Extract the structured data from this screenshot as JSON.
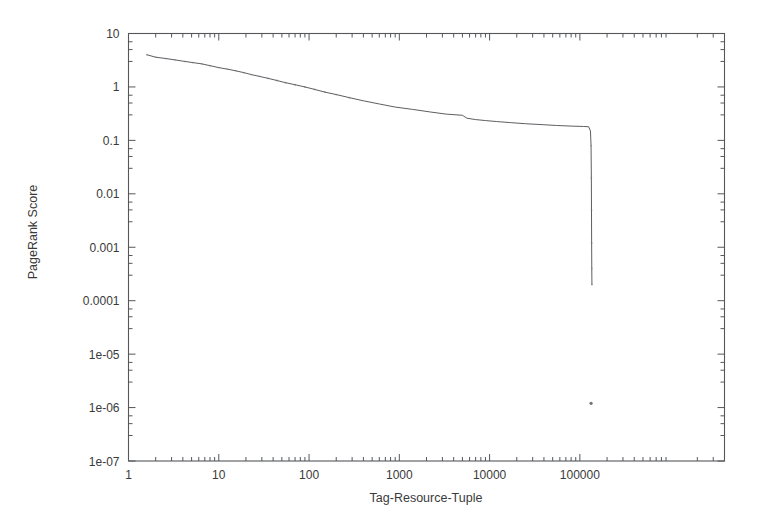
{
  "chart_data": {
    "type": "line",
    "title": "",
    "subtitle": "",
    "xlabel": "Tag-Resource-Tuple",
    "ylabel": "PageRank Score",
    "xscale": "log",
    "yscale": "log",
    "xlim": [
      1,
      4000000
    ],
    "ylim": [
      1e-07,
      10
    ],
    "grid": false,
    "legend": null,
    "legend_position": "none",
    "xticks": [
      1,
      10,
      100,
      1000,
      10000,
      100000
    ],
    "xtick_labels": [
      "1",
      "10",
      "100",
      "1000",
      "10000",
      "100000"
    ],
    "yticks": [
      10,
      1,
      0.1,
      0.01,
      0.001,
      0.0001,
      1e-05,
      1e-06,
      1e-07
    ],
    "ytick_labels": [
      "10",
      "1",
      "0.1",
      "0.01",
      "0.001",
      "0.0001",
      "1e-05",
      "1e-06",
      "1e-07"
    ],
    "series": [
      {
        "name": "PageRank distribution",
        "marker": "dots-then-line",
        "x": [
          1.6,
          2.0,
          2.6,
          3.3,
          4.2,
          5.2,
          6.5,
          8.0,
          10.0,
          12.5,
          15.5,
          19.0,
          23.0,
          28.0,
          35.0,
          44.0,
          55.0,
          70.0,
          90.0,
          115.0,
          150.0,
          200.0,
          280.0,
          400.0,
          600.0,
          900.0,
          1400.0,
          2200.0,
          3300.0,
          5000.0,
          5600.0,
          7000.0,
          9000.0,
          12000.0,
          17000.0,
          25000.0,
          38000.0,
          55000.0,
          80000.0,
          110000.0,
          125000.0,
          131000.0,
          133000.0,
          134000.0,
          134500.0,
          135000.0,
          135500.0,
          136000.0
        ],
        "y": [
          4.0,
          3.6,
          3.4,
          3.2,
          3.0,
          2.85,
          2.7,
          2.5,
          2.3,
          2.15,
          2.0,
          1.85,
          1.7,
          1.58,
          1.45,
          1.32,
          1.2,
          1.1,
          1.0,
          0.9,
          0.8,
          0.72,
          0.63,
          0.55,
          0.48,
          0.42,
          0.38,
          0.34,
          0.31,
          0.295,
          0.26,
          0.245,
          0.235,
          0.225,
          0.215,
          0.205,
          0.197,
          0.19,
          0.185,
          0.182,
          0.18,
          0.15,
          0.08,
          0.02,
          0.005,
          0.0012,
          0.0004,
          0.0002
        ],
        "notes": "Rank-ordered PageRank scores: slow power-law-like decay from ~4 down to a plateau near 0.18, followed by a near-vertical cliff at roughly 130,000 tuples dropping to ~2e-04."
      },
      {
        "name": "outlier",
        "marker": "point",
        "x": [
          133000.0
        ],
        "y": [
          1.2e-06
        ],
        "notes": "Single isolated low-score point near 1.2e-06."
      }
    ],
    "annotations": []
  },
  "figure": {
    "background_color": "#ffffff",
    "axis_color": "#55575a",
    "series_color": "#4a4c50"
  }
}
